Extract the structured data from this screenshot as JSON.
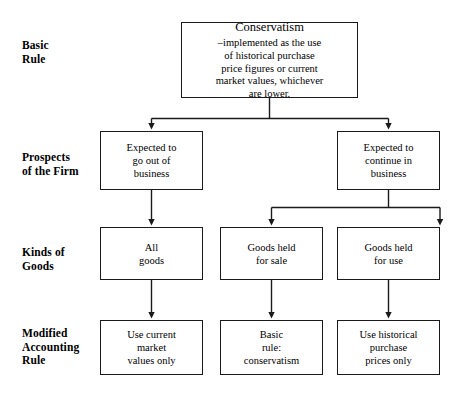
{
  "diagram": {
    "colors": {
      "background": "#ffffff",
      "stroke": "#1a1a1a",
      "text": "#000000"
    },
    "row_labels": [
      {
        "id": "basic-rule",
        "text": "Basic\nRule"
      },
      {
        "id": "prospects-of-the-firm",
        "text": "Prospects\nof the Firm"
      },
      {
        "id": "kinds-of-goods",
        "text": "Kinds of\nGoods"
      },
      {
        "id": "modified-accounting-rule",
        "text": "Modified\nAccounting\nRule"
      }
    ],
    "nodes": {
      "root": {
        "title": "Conservatism",
        "body": "–implemented as the use\nof historical purchase\nprice figures or current\nmarket values, whichever\nare lower."
      },
      "prospect_left": {
        "text": "Expected to\ngo out of\nbusiness"
      },
      "prospect_right": {
        "text": "Expected to\ncontinue in\nbusiness"
      },
      "goods_all": {
        "text": "All\ngoods"
      },
      "goods_for_sale": {
        "text": "Goods held\nfor sale"
      },
      "goods_for_use": {
        "text": "Goods held\nfor use"
      },
      "rule_left": {
        "text": "Use current\nmarket\nvalues only"
      },
      "rule_middle": {
        "text": "Basic\nrule:\nconservatism"
      },
      "rule_right": {
        "text": "Use historical\npurchase\nprices only"
      }
    }
  }
}
